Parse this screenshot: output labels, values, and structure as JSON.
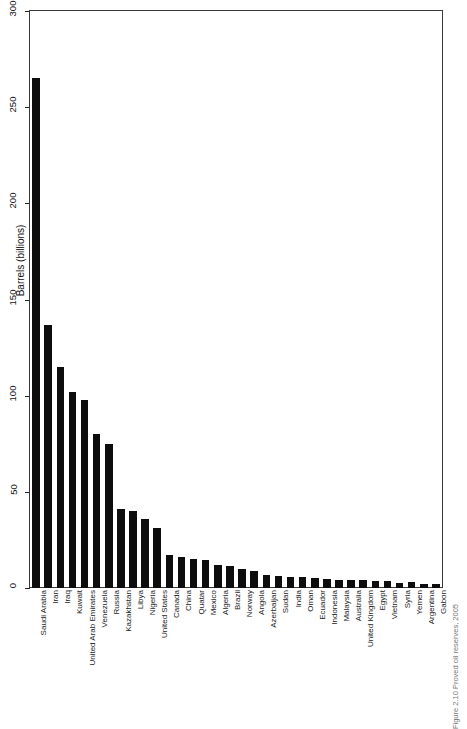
{
  "chart_data": {
    "type": "bar",
    "title": "",
    "xlabel": "",
    "ylabel": "Barrels (billions)",
    "ylim": [
      0,
      300
    ],
    "yticks": [
      0,
      50,
      100,
      150,
      200,
      250,
      300
    ],
    "grid": false,
    "legend": null,
    "bar_color": "#0d0d0d",
    "categories": [
      "Saudi Arabia",
      "Iran",
      "Iraq",
      "Kuwait",
      "United Arab Emirates",
      "Venezuela",
      "Russia",
      "Kazakhstan",
      "Libya",
      "Nigeria",
      "United States",
      "Canada",
      "China",
      "Quatar",
      "Mexico",
      "Algeria",
      "Brazil",
      "Norway",
      "Angola",
      "Azerbaijan",
      "Sudan",
      "India",
      "Oman",
      "Ecuador",
      "Indonesia",
      "Malaysia",
      "Australia",
      "United Kingdom",
      "Egypt",
      "Vietnam",
      "Syria",
      "Yemen",
      "Argentina",
      "Gabon"
    ],
    "values": [
      265,
      137,
      115,
      102,
      98,
      80,
      75,
      41,
      40,
      36,
      31,
      17,
      16,
      15,
      14.6,
      12,
      11.5,
      9.7,
      9,
      7,
      6.4,
      5.8,
      5.6,
      5.1,
      4.7,
      4.2,
      4,
      4,
      3.7,
      3.4,
      2.5,
      2.9,
      2.3,
      2
    ]
  },
  "caption": {
    "text": "Figure 2.10  Proved oil reserves, 2005"
  }
}
